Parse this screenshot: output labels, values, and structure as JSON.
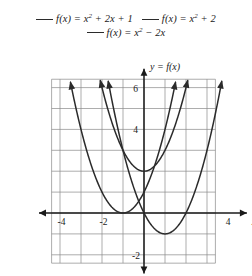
{
  "legend": {
    "rows": [
      [
        {
          "id": "curve-1",
          "label": "f(x) = x² + 2x + 1",
          "fn": "f(x)",
          "base": "x",
          "exp": "2",
          "rest": " + 2x + 1",
          "color": "#2b2b2b"
        },
        {
          "id": "curve-2",
          "label": "f(x) = x² + 2",
          "fn": "f(x)",
          "base": "x",
          "exp": "2",
          "rest": " + 2",
          "color": "#2b2b2b"
        }
      ],
      [
        {
          "id": "curve-3",
          "label": "f(x) = x² − 2x",
          "fn": "f(x)",
          "base": "x",
          "exp": "2",
          "rest": " − 2x",
          "color": "#2b2b2b"
        }
      ]
    ]
  },
  "chart_data": {
    "type": "line",
    "title": "",
    "xlabel": "x",
    "ylabel": "y = f(x)",
    "xlim": [
      -4.7,
      4.7
    ],
    "ylim": [
      -2.6,
      6.6
    ],
    "grid": true,
    "grid_spacing": 1,
    "grid_extent": {
      "x": [
        -4.4,
        3.4
      ],
      "y": [
        -2.4,
        6.4
      ]
    },
    "legend_position": "top",
    "x_ticks": [
      -4,
      -2,
      4
    ],
    "x_tick_labels": [
      "-4",
      "-2",
      "4"
    ],
    "y_ticks": [
      -2,
      4,
      6
    ],
    "y_tick_labels": [
      "-2",
      "4",
      "6"
    ],
    "series": [
      {
        "name": "f(x) = x² + 2x + 1",
        "expression": "x^2 + 2x + 1",
        "vertex": [
          -1,
          0
        ],
        "color": "#2b2b2b",
        "x": [
          -3.6,
          -3.2,
          -2.8,
          -2.4,
          -2.0,
          -1.6,
          -1.2,
          -1.0,
          -0.8,
          -0.4,
          0.0,
          0.4,
          0.8,
          1.2,
          1.4
        ],
        "y": [
          6.76,
          4.84,
          3.24,
          1.96,
          1.0,
          0.36,
          0.04,
          0.0,
          0.04,
          0.36,
          1.0,
          1.96,
          3.24,
          4.84,
          5.76
        ]
      },
      {
        "name": "f(x) = x² + 2",
        "expression": "x^2 + 2",
        "vertex": [
          0,
          2
        ],
        "color": "#2b2b2b",
        "x": [
          -2.0,
          -1.8,
          -1.4,
          -1.0,
          -0.6,
          -0.2,
          0.0,
          0.2,
          0.6,
          1.0,
          1.4,
          1.8,
          2.0
        ],
        "y": [
          6.0,
          5.24,
          3.96,
          3.0,
          2.36,
          2.04,
          2.0,
          2.04,
          2.36,
          3.0,
          3.96,
          5.24,
          6.0
        ]
      },
      {
        "name": "f(x) = x² − 2x",
        "expression": "x^2 - 2x",
        "vertex": [
          1,
          -1
        ],
        "color": "#2b2b2b",
        "x": [
          -1.4,
          -1.0,
          -0.6,
          -0.2,
          0.2,
          0.6,
          1.0,
          1.4,
          1.8,
          2.2,
          2.6,
          3.0,
          3.4
        ],
        "y": [
          4.76,
          3.0,
          1.56,
          0.44,
          -0.36,
          -0.84,
          -1.0,
          -0.84,
          -0.36,
          0.44,
          1.56,
          3.0,
          4.76
        ]
      }
    ]
  }
}
